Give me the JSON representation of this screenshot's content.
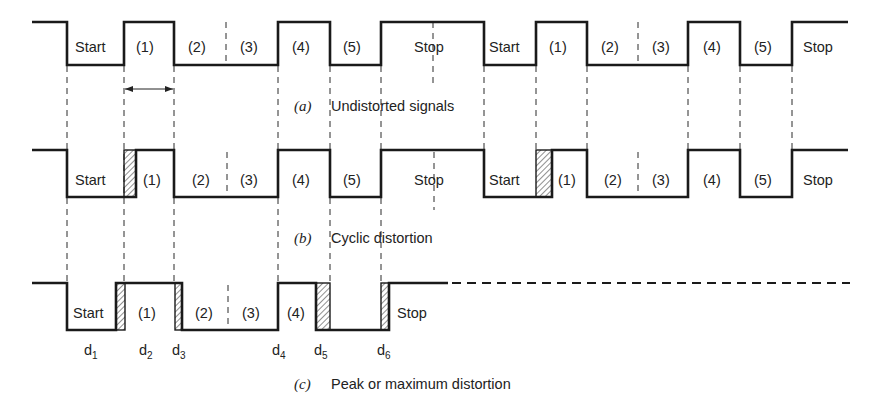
{
  "figure": {
    "panels": [
      {
        "id": "a",
        "caption_letter": "(a)",
        "caption_text": "Undistorted signals",
        "labels": [
          "Start",
          "(1)",
          "(2)",
          "(3)",
          "(4)",
          "(5)",
          "Stop",
          "Start",
          "(1)",
          "(2)",
          "(3)",
          "(4)",
          "(5)",
          "Stop"
        ]
      },
      {
        "id": "b",
        "caption_letter": "(b)",
        "caption_text": "Cyclic distortion",
        "labels": [
          "Start",
          "(1)",
          "(2)",
          "(3)",
          "(4)",
          "(5)",
          "Stop",
          "Start",
          "(1)",
          "(2)",
          "(3)",
          "(4)",
          "(5)",
          "Stop"
        ]
      },
      {
        "id": "c",
        "caption_letter": "(c)",
        "caption_text": "Peak or maximum distortion",
        "labels": [
          "Start",
          "(1)",
          "(2)",
          "(3)",
          "(4)",
          "Stop"
        ],
        "distortion_markers": [
          {
            "base": "d",
            "sub": "1"
          },
          {
            "base": "d",
            "sub": "2"
          },
          {
            "base": "d",
            "sub": "3"
          },
          {
            "base": "d",
            "sub": "4"
          },
          {
            "base": "d",
            "sub": "5"
          },
          {
            "base": "d",
            "sub": "6"
          }
        ]
      }
    ],
    "colors": {
      "line": "#1a1a1a",
      "background": "#ffffff"
    }
  }
}
